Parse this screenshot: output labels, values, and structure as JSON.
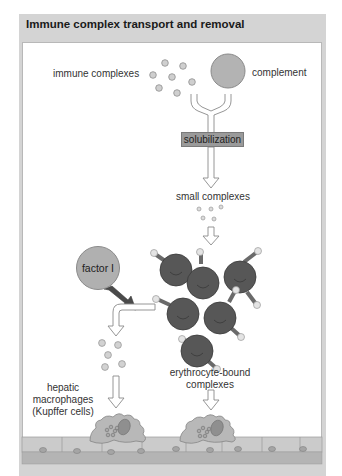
{
  "figure": {
    "title": "Immune complex transport and removal"
  },
  "labels": {
    "immune_complexes": "immune complexes",
    "complement": "complement",
    "solubilization": "solubilization",
    "small_complexes": "small complexes",
    "factor_i": "factor I",
    "hepatic_line1": "hepatic",
    "hepatic_line2": "macrophages",
    "hepatic_line3": "(Kupffer cells)",
    "erythro_line1": "erythrocyte-bound",
    "erythro_line2": "complexes"
  },
  "colors": {
    "frame": "#d4d4d4",
    "panel": "#ffffff",
    "complement": "#b3b3b3",
    "erythrocyte": "#555555",
    "macrophage": "#b5b5b5",
    "endothelium": "#c8c8c8",
    "arrow_outline": "#8a8a8a",
    "factor_arrow": "#4a4a4a"
  },
  "nodes": [
    {
      "id": "immune-complexes",
      "label": "immune complexes"
    },
    {
      "id": "complement",
      "label": "complement"
    },
    {
      "id": "solubilization",
      "label": "solubilization"
    },
    {
      "id": "small-complexes",
      "label": "small complexes"
    },
    {
      "id": "factor-i",
      "label": "factor I"
    },
    {
      "id": "erythrocyte-bound-complexes",
      "label": "erythrocyte-bound complexes"
    },
    {
      "id": "hepatic-macrophages",
      "label": "hepatic macrophages (Kupffer cells)"
    }
  ],
  "edges": [
    {
      "from": "immune-complexes",
      "to": "solubilization"
    },
    {
      "from": "complement",
      "to": "solubilization"
    },
    {
      "from": "solubilization",
      "to": "small-complexes"
    },
    {
      "from": "small-complexes",
      "to": "erythrocyte-bound-complexes"
    },
    {
      "from": "factor-i",
      "to": "erythrocyte-bound-complexes",
      "note": "releases complexes"
    },
    {
      "from": "erythrocyte-bound-complexes",
      "to": "hepatic-macrophages"
    }
  ]
}
